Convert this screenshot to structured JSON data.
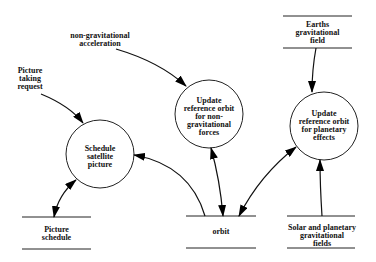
{
  "diagram": {
    "type": "data-flow-diagram",
    "processes": [
      {
        "id": "p1",
        "label_lines": [
          "Update",
          "reference orbit",
          "for non-",
          "gravitational",
          "forces"
        ]
      },
      {
        "id": "p2",
        "label_lines": [
          "Update",
          "reference orbit",
          "for planetary",
          "effects"
        ]
      },
      {
        "id": "p3",
        "label_lines": [
          "Schedule",
          "satellite",
          "picture"
        ]
      }
    ],
    "stores": [
      {
        "id": "s1",
        "label_lines": [
          "Earths",
          "gravitational",
          "field"
        ]
      },
      {
        "id": "s2",
        "label_lines": [
          "Picture",
          "schedule"
        ]
      },
      {
        "id": "s3",
        "label_lines": [
          "orbit"
        ]
      },
      {
        "id": "s4",
        "label_lines": [
          "Solar and planetary",
          "gravitational",
          "fields"
        ]
      }
    ],
    "externals": [
      {
        "id": "e1",
        "label_lines": [
          "non-gravitational",
          "acceleration"
        ]
      },
      {
        "id": "e2",
        "label_lines": [
          "Picture",
          "taking",
          "request"
        ]
      }
    ],
    "flows": [
      {
        "from": "non-gravitational acceleration",
        "to": "Update reference orbit for non-gravitational forces",
        "direction": "one-way"
      },
      {
        "from": "Picture taking request",
        "to": "Schedule satellite picture",
        "direction": "one-way"
      },
      {
        "from": "Earths gravitational field",
        "to": "Update reference orbit for planetary effects",
        "direction": "one-way"
      },
      {
        "from": "Solar and planetary gravitational fields",
        "to": "Update reference orbit for planetary effects",
        "direction": "one-way"
      },
      {
        "from": "orbit",
        "to": "Schedule satellite picture",
        "direction": "one-way"
      },
      {
        "from": "orbit",
        "to": "Update reference orbit for non-gravitational forces",
        "direction": "two-way"
      },
      {
        "from": "orbit",
        "to": "Update reference orbit for planetary effects",
        "direction": "two-way"
      },
      {
        "from": "Picture schedule",
        "to": "Schedule satellite picture",
        "direction": "two-way"
      }
    ]
  }
}
